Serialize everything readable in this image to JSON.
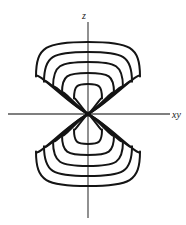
{
  "figure": {
    "name": "dz2-orbital-contour-diagram",
    "background_color": "#ffffff",
    "ink_color": "#141414",
    "axis_color": "#555555"
  },
  "axes": {
    "vertical": {
      "label": "z",
      "x": 88,
      "y_top": 22,
      "y_bottom": 218,
      "stroke_width": 1.3
    },
    "horizontal": {
      "label": "xy",
      "y": 114,
      "x_left": 8,
      "x_right": 170,
      "stroke_width": 1.3
    },
    "origin": {
      "x": 88,
      "y": 114
    }
  },
  "labels": {
    "z_label": "z",
    "z_label_x": 84,
    "z_label_y": 19,
    "xy_label": "xy",
    "xy_label_x": 172,
    "xy_label_y": 118
  },
  "chart_data": {
    "type": "contour",
    "title": "",
    "xlabel": "xy",
    "ylabel": "z",
    "lobes": [
      {
        "name": "upper-lobe",
        "direction": "+z",
        "contour_count": 5,
        "contours": [
          {
            "index": 1,
            "level": "outermost",
            "half_width": 52,
            "apex_extent": 72,
            "stroke_width": 2.0
          },
          {
            "index": 2,
            "level": "outer",
            "half_width": 44,
            "apex_extent": 62,
            "stroke_width": 2.0
          },
          {
            "index": 3,
            "level": "middle",
            "half_width": 35,
            "apex_extent": 52,
            "stroke_width": 2.0
          },
          {
            "index": 4,
            "level": "inner",
            "half_width": 26,
            "apex_extent": 41,
            "stroke_width": 2.0
          },
          {
            "index": 5,
            "level": "innermost",
            "half_width": 14,
            "apex_extent": 30,
            "stroke_width": 2.0
          }
        ]
      },
      {
        "name": "lower-lobe",
        "direction": "-z",
        "contour_count": 5,
        "contours": [
          {
            "index": 1,
            "level": "outermost",
            "half_width": 52,
            "apex_extent": 72,
            "stroke_width": 2.0
          },
          {
            "index": 2,
            "level": "outer",
            "half_width": 44,
            "apex_extent": 62,
            "stroke_width": 2.0
          },
          {
            "index": 3,
            "level": "middle",
            "half_width": 35,
            "apex_extent": 52,
            "stroke_width": 2.0
          },
          {
            "index": 4,
            "level": "inner",
            "half_width": 26,
            "apex_extent": 41,
            "stroke_width": 2.0
          },
          {
            "index": 5,
            "level": "innermost",
            "half_width": 14,
            "apex_extent": 30,
            "stroke_width": 2.0
          }
        ]
      }
    ],
    "node": {
      "name": "nodal-point",
      "x": 88,
      "y": 114,
      "note": "all contours pinch to the origin"
    },
    "grid": false,
    "legend": null
  }
}
